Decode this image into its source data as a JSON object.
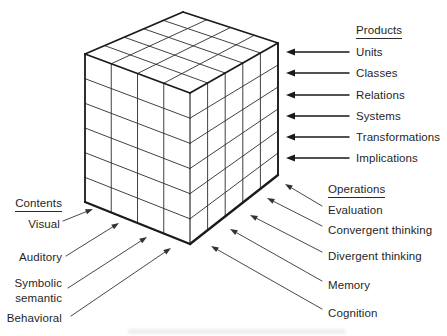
{
  "products": {
    "heading": "Products",
    "items": [
      "Units",
      "Classes",
      "Relations",
      "Systems",
      "Transformations",
      "Implications"
    ]
  },
  "operations": {
    "heading": "Operations",
    "items": [
      "Evaluation",
      "Convergent thinking",
      "Divergent thinking",
      "Memory",
      "Cognition"
    ]
  },
  "contents": {
    "heading": "Contents",
    "items": [
      [
        "Visual"
      ],
      [
        "Auditory"
      ],
      [
        "Symbolic",
        "semantic"
      ],
      [
        "Behavioral"
      ]
    ]
  },
  "cube": {
    "contents_columns": 4,
    "operations_columns": 5,
    "products_rows": 6
  },
  "colors": {
    "background": "#ffffff",
    "line": "#1a1a1a",
    "grid_line": "#2b2b2b",
    "text": "#1f1f1f"
  }
}
